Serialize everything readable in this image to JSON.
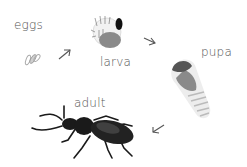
{
  "diagram": {
    "type": "life-cycle",
    "stages": [
      {
        "id": "eggs",
        "label": "eggs"
      },
      {
        "id": "larva",
        "label": "larva"
      },
      {
        "id": "pupa",
        "label": "pupa"
      },
      {
        "id": "adult",
        "label": "adult"
      }
    ],
    "arrows": [
      {
        "from": "eggs",
        "to": "larva",
        "icon": "arrow-up-right-icon"
      },
      {
        "from": "larva",
        "to": "pupa",
        "icon": "arrow-down-right-icon"
      },
      {
        "from": "pupa",
        "to": "adult",
        "icon": "arrow-down-left-icon"
      }
    ],
    "colors": {
      "text": "#555555",
      "arrow": "#555555",
      "beetle": "#1a1a1a",
      "larva_body": "#8a8a8a",
      "pupa_head": "#5a5a5a"
    }
  }
}
